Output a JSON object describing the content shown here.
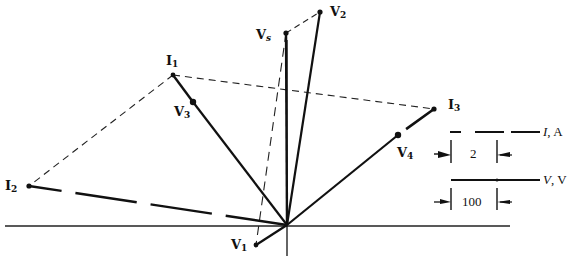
{
  "diagram": {
    "type": "phasor-diagram",
    "colors": {
      "ink": "#111111",
      "background": "#ffffff"
    },
    "origin": {
      "x": 287,
      "y": 225
    },
    "axes": {
      "horizontal": {
        "x1": 5,
        "y1": 226,
        "x2": 510,
        "y2": 226
      },
      "vertical": {
        "x1": 287,
        "y1": 40,
        "x2": 287,
        "y2": 256
      }
    },
    "phasors": [
      {
        "name": "Vs",
        "label_main": "V",
        "label_sub": "s",
        "kind": "voltage",
        "tip": {
          "x": 286,
          "y": 33
        },
        "label_pos": {
          "x": 256,
          "y": 30
        }
      },
      {
        "name": "V2",
        "label_main": "V",
        "label_sub": "2",
        "kind": "voltage",
        "tip": {
          "x": 320,
          "y": 12
        },
        "label_pos": {
          "x": 330,
          "y": 6
        }
      },
      {
        "name": "V3",
        "label_main": "V",
        "label_sub": "3",
        "kind": "voltage",
        "tip": {
          "x": 193,
          "y": 102
        },
        "label_pos": {
          "x": 174,
          "y": 106
        }
      },
      {
        "name": "V4",
        "label_main": "V",
        "label_sub": "4",
        "kind": "voltage",
        "tip": {
          "x": 398,
          "y": 135
        },
        "label_pos": {
          "x": 397,
          "y": 146
        }
      },
      {
        "name": "V1",
        "label_main": "V",
        "label_sub": "1",
        "kind": "voltage",
        "tip": {
          "x": 256,
          "y": 245
        },
        "label_pos": {
          "x": 231,
          "y": 240
        }
      },
      {
        "name": "I1",
        "label_main": "I",
        "label_sub": "1",
        "kind": "current",
        "tip": {
          "x": 173,
          "y": 75
        },
        "label_pos": {
          "x": 166,
          "y": 55
        }
      },
      {
        "name": "I2",
        "label_main": "I",
        "label_sub": "2",
        "kind": "current",
        "tip": {
          "x": 29,
          "y": 186
        },
        "label_pos": {
          "x": 5,
          "y": 180
        }
      },
      {
        "name": "I3",
        "label_main": "I",
        "label_sub": "3",
        "kind": "current",
        "tip": {
          "x": 434,
          "y": 109
        },
        "label_pos": {
          "x": 448,
          "y": 99
        }
      }
    ],
    "construction_lines": [
      {
        "from": "I1",
        "to": "I3",
        "style": "dashed"
      },
      {
        "from": "I1",
        "to": "I2",
        "style": "dashed"
      },
      {
        "from": "Vs",
        "to": "V2",
        "style": "dashed"
      },
      {
        "from": "Vs",
        "to": "V1",
        "style": "dashed"
      }
    ],
    "legend": {
      "current_scale": {
        "axis_label_var": "I",
        "axis_label_unit": ", A",
        "value": "2",
        "line_style": "dashed"
      },
      "voltage_scale": {
        "axis_label_var": "V",
        "axis_label_unit": ", V",
        "value": "100",
        "line_style": "solid"
      }
    }
  }
}
